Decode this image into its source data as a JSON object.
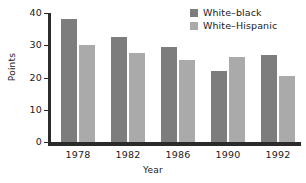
{
  "chart_data": {
    "type": "bar",
    "title": "",
    "xlabel": "Year",
    "ylabel": "Points",
    "categories": [
      "1978",
      "1982",
      "1986",
      "1990",
      "1992"
    ],
    "series": [
      {
        "name": "White–black",
        "color": "#7d7d7d",
        "values": [
          38,
          32.5,
          29.5,
          22,
          27
        ]
      },
      {
        "name": "White–Hispanic",
        "color": "#aaaaaa",
        "values": [
          30,
          27.5,
          25.5,
          26.5,
          20.5
        ]
      }
    ],
    "ylim": [
      0,
      40
    ],
    "yticks": [
      "0",
      "10",
      "20",
      "30",
      "40"
    ],
    "ytick_values": [
      0,
      10,
      20,
      30,
      40
    ],
    "grid": false,
    "legend_position": "top-right"
  },
  "legend": {
    "items": [
      {
        "label": "White–black",
        "swatch": "legend-swatch-white-black"
      },
      {
        "label": "White–Hispanic",
        "swatch": "legend-swatch-white-hispanic"
      }
    ]
  }
}
